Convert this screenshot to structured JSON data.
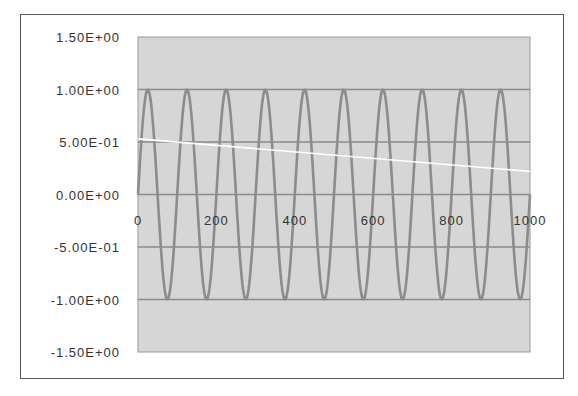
{
  "chart_data": {
    "type": "line",
    "title": "",
    "xlabel": "",
    "ylabel": "",
    "xlim": [
      0,
      1000
    ],
    "ylim": [
      -1.5,
      1.5
    ],
    "x_ticks": [
      "0",
      "200",
      "400",
      "600",
      "800",
      "1000"
    ],
    "y_ticks": [
      "1.50E+00",
      "1.00E+00",
      "5.00E-01",
      "0.00E+00",
      "-5.00E-01",
      "-1.00E+00",
      "-1.50E+00"
    ],
    "grid": true,
    "legend": null,
    "series": [
      {
        "name": "sine",
        "color": "#8c8c8c",
        "description": "y = sin(2*pi*x/100), x from 0 to 1000, 10 full cycles, amplitude 1",
        "period": 100,
        "amplitude": 1,
        "x_range": [
          0,
          1000
        ]
      },
      {
        "name": "trend",
        "color": "#ffffff",
        "description": "straight line",
        "x": [
          0,
          1000
        ],
        "y": [
          0.53,
          0.22
        ]
      }
    ],
    "plot_background": "#d6d6d6",
    "gridline_color": "#8a8a8a"
  }
}
